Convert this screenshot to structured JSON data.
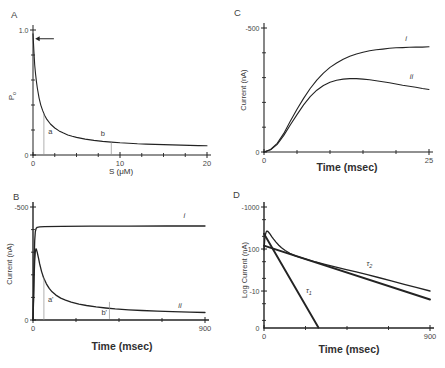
{
  "figure": {
    "ink": "#232323",
    "text_color": "#484848",
    "marker_color": "#8f8f8f",
    "background": "#ffffff"
  },
  "chart_data": [
    {
      "panel": "A",
      "type": "line",
      "xlabel": "S  (μM)",
      "ylabel": {
        "text": "P",
        "sub": "o"
      },
      "x_range": [
        0,
        20
      ],
      "y_range": [
        0,
        1.0
      ],
      "y_scale": "linear",
      "x_ticks": {
        "major": [
          {
            "v": 0,
            "label": "0"
          },
          {
            "v": 10,
            "label": "10"
          },
          {
            "v": 20,
            "label": "20"
          }
        ],
        "minor": [
          2.5,
          5,
          7.5,
          12.5,
          15,
          17.5
        ]
      },
      "y_ticks": {
        "major": [
          {
            "v": 1.0,
            "label": "1.0"
          },
          {
            "v": 0,
            "label": "0"
          }
        ],
        "minor": [
          0.2,
          0.4,
          0.6,
          0.8
        ]
      },
      "series": [
        {
          "name": "open-probability-vs-concentration",
          "width": 1.1,
          "points": [
            [
              0,
              0.97
            ],
            [
              0.1,
              0.83
            ],
            [
              0.2,
              0.72
            ],
            [
              0.3,
              0.645
            ],
            [
              0.4,
              0.583
            ],
            [
              0.5,
              0.532
            ],
            [
              0.7,
              0.455
            ],
            [
              0.9,
              0.399
            ],
            [
              1.1,
              0.357
            ],
            [
              1.35,
              0.316
            ],
            [
              1.6,
              0.285
            ],
            [
              2,
              0.248
            ],
            [
              2.5,
              0.216
            ],
            [
              3,
              0.193
            ],
            [
              3.5,
              0.175
            ],
            [
              4,
              0.161
            ],
            [
              4.5,
              0.15
            ],
            [
              5,
              0.141
            ],
            [
              6,
              0.127
            ],
            [
              7,
              0.117
            ],
            [
              8,
              0.109
            ],
            [
              9,
              0.103
            ],
            [
              10,
              0.098
            ],
            [
              11,
              0.094
            ],
            [
              12,
              0.09
            ],
            [
              13,
              0.087
            ],
            [
              14,
              0.085
            ],
            [
              15,
              0.083
            ],
            [
              16,
              0.081
            ],
            [
              17,
              0.079
            ],
            [
              18,
              0.077
            ],
            [
              19,
              0.075
            ],
            [
              20,
              0.074
            ]
          ]
        }
      ],
      "annotations": [
        {
          "type": "arrow",
          "y": 0.93,
          "x_from": 2.4,
          "x_to": 0.25
        },
        {
          "type": "vline",
          "x": 1.25,
          "y_from": 0,
          "y_to": 0.335
        },
        {
          "type": "vline",
          "x": 9,
          "y_from": 0,
          "y_to": 0.103
        },
        {
          "type": "text",
          "x": 1.75,
          "y": 0.17,
          "text": "a"
        },
        {
          "type": "text",
          "x": 7.8,
          "y": 0.155,
          "text": "b"
        }
      ],
      "layout": {
        "x0": 33,
        "x1": 207,
        "y0": 155,
        "y1": 30,
        "axis_w": 1.0,
        "panel_xy": [
          11,
          18
        ],
        "ylabel_xy": [
          14,
          96
        ],
        "ylabel_size": 8,
        "xlabel_xy": [
          121,
          174
        ],
        "xlabel_size": 8,
        "xlabel_weight": "normal"
      }
    },
    {
      "panel": "C",
      "type": "line",
      "xlabel": "Time (msec)",
      "ylabel": {
        "text": "Current  (nA)",
        "sub": ""
      },
      "x_range": [
        0,
        25
      ],
      "y_range": [
        0,
        500
      ],
      "y_scale": "linear",
      "x_ticks": {
        "major": [
          {
            "v": 0,
            "label": "0"
          },
          {
            "v": 25,
            "label": "25"
          }
        ],
        "minor": [
          5,
          10,
          15,
          20
        ]
      },
      "y_ticks": {
        "major": [
          {
            "v": 500,
            "label": "-500"
          },
          {
            "v": 0,
            "label": "0"
          }
        ],
        "minor": [
          100,
          200,
          300,
          400
        ]
      },
      "series": [
        {
          "name": "current-trace-i",
          "width": 1.1,
          "points": [
            [
              0,
              0
            ],
            [
              1,
              -10
            ],
            [
              2,
              -35
            ],
            [
              3,
              -75
            ],
            [
              4,
              -125
            ],
            [
              5,
              -172
            ],
            [
              6,
              -216
            ],
            [
              7,
              -256
            ],
            [
              8,
              -290
            ],
            [
              9,
              -318
            ],
            [
              10,
              -341
            ],
            [
              11,
              -359
            ],
            [
              12,
              -374
            ],
            [
              13,
              -386
            ],
            [
              14,
              -395
            ],
            [
              15,
              -402
            ],
            [
              16,
              -408
            ],
            [
              17,
              -412
            ],
            [
              18,
              -415
            ],
            [
              19,
              -418
            ],
            [
              20,
              -420
            ],
            [
              21,
              -421
            ],
            [
              22,
              -422
            ],
            [
              23,
              -423
            ],
            [
              24,
              -423
            ],
            [
              25,
              -424
            ]
          ]
        },
        {
          "name": "current-trace-ii",
          "width": 1.1,
          "points": [
            [
              0,
              0
            ],
            [
              1,
              -9
            ],
            [
              2,
              -31
            ],
            [
              3,
              -67
            ],
            [
              4,
              -110
            ],
            [
              5,
              -151
            ],
            [
              6,
              -190
            ],
            [
              7,
              -223
            ],
            [
              8,
              -249
            ],
            [
              9,
              -268
            ],
            [
              10,
              -281
            ],
            [
              11,
              -289
            ],
            [
              12,
              -294
            ],
            [
              13,
              -296
            ],
            [
              14,
              -296
            ],
            [
              15,
              -294
            ],
            [
              16,
              -291
            ],
            [
              17,
              -287
            ],
            [
              18,
              -283
            ],
            [
              19,
              -279
            ],
            [
              20,
              -274
            ],
            [
              21,
              -269
            ],
            [
              22,
              -265
            ],
            [
              23,
              -261
            ],
            [
              24,
              -256
            ],
            [
              25,
              -252
            ]
          ]
        }
      ],
      "annotations": [
        {
          "type": "text",
          "x": 21.4,
          "y": -447,
          "text": "i",
          "italic": true
        },
        {
          "type": "text",
          "x": 22.1,
          "y": -296,
          "text": "ii",
          "italic": true
        }
      ],
      "layout": {
        "x0": 42,
        "x1": 207,
        "y0": 152,
        "y1": 28,
        "axis_w": 1.1,
        "panel_xy": [
          12,
          16
        ],
        "ylabel_xy": [
          24,
          90
        ],
        "ylabel_size": 7.5,
        "xlabel_xy": [
          125,
          171
        ],
        "xlabel_size": 10.5,
        "xlabel_weight": "bold"
      }
    },
    {
      "panel": "B",
      "type": "line",
      "xlabel": "Time (msec)",
      "ylabel": {
        "text": "Current  (nA)",
        "sub": ""
      },
      "x_range": [
        0,
        900
      ],
      "y_range": [
        0,
        500
      ],
      "y_scale": "linear",
      "x_ticks": {
        "major": [
          {
            "v": 0,
            "label": "0"
          },
          {
            "v": 900,
            "label": "900"
          }
        ],
        "minor": [
          225,
          450,
          675
        ]
      },
      "y_ticks": {
        "major": [
          {
            "v": 500,
            "label": "-500"
          },
          {
            "v": 0,
            "label": "0"
          }
        ],
        "minor": [
          100,
          200,
          300,
          400
        ]
      },
      "series": [
        {
          "name": "current-trace-i",
          "width": 1.3,
          "points": [
            [
              0,
              0
            ],
            [
              3,
              -120
            ],
            [
              6,
              -260
            ],
            [
              9,
              -350
            ],
            [
              12,
              -390
            ],
            [
              16,
              -405
            ],
            [
              22,
              -410
            ],
            [
              35,
              -412
            ],
            [
              60,
              -413
            ],
            [
              150,
              -414
            ],
            [
              300,
              -415
            ],
            [
              500,
              -415
            ],
            [
              700,
              -416
            ],
            [
              900,
              -416
            ]
          ]
        },
        {
          "name": "current-trace-ii",
          "width": 1.3,
          "points": [
            [
              0,
              0
            ],
            [
              3,
              -90
            ],
            [
              6,
              -190
            ],
            [
              9,
              -260
            ],
            [
              12,
              -300
            ],
            [
              15,
              -315
            ],
            [
              18,
              -313
            ],
            [
              22,
              -300
            ],
            [
              28,
              -276
            ],
            [
              35,
              -248
            ],
            [
              45,
              -214
            ],
            [
              55,
              -188
            ],
            [
              70,
              -160
            ],
            [
              85,
              -140
            ],
            [
              100,
              -125
            ],
            [
              120,
              -110
            ],
            [
              145,
              -97
            ],
            [
              170,
              -88
            ],
            [
              200,
              -79
            ],
            [
              240,
              -70
            ],
            [
              280,
              -64
            ],
            [
              330,
              -58
            ],
            [
              380,
              -53
            ],
            [
              430,
              -49
            ],
            [
              500,
              -45
            ],
            [
              570,
              -42
            ],
            [
              650,
              -39
            ],
            [
              730,
              -37
            ],
            [
              820,
              -35
            ],
            [
              900,
              -33
            ]
          ]
        }
      ],
      "annotations": [
        {
          "type": "vline",
          "x": 57,
          "y_from": 0,
          "y_to": -188
        },
        {
          "type": "text",
          "x": 78,
          "y": -78,
          "text": "a'"
        },
        {
          "type": "vline",
          "x": 400,
          "y_from": -5,
          "y_to": -80
        },
        {
          "type": "text",
          "x": 358,
          "y": -20,
          "text": "b'"
        },
        {
          "type": "text",
          "x": 788,
          "y": -450,
          "text": "i",
          "italic": true
        },
        {
          "type": "text",
          "x": 760,
          "y": -52,
          "text": "ii",
          "italic": true
        }
      ],
      "layout": {
        "x0": 33,
        "x1": 205,
        "y0": 136,
        "y1": 23,
        "axis_w": 1.4,
        "panel_xy": [
          13,
          16
        ],
        "ylabel_xy": [
          12,
          80
        ],
        "ylabel_size": 7.5,
        "xlabel_xy": [
          122,
          166
        ],
        "xlabel_size": 10.5,
        "xlabel_weight": "bold"
      }
    },
    {
      "panel": "D",
      "type": "line",
      "xlabel": "Time (msec)",
      "ylabel": {
        "text": "Log Current  (nA)",
        "sub": ""
      },
      "x_range": [
        0,
        900
      ],
      "y_range": [
        1.32,
        1000
      ],
      "y_scale": "log",
      "y_base_label": "0",
      "x_ticks": {
        "major": [
          {
            "v": 0,
            "label": "0"
          },
          {
            "v": 900,
            "label": "900"
          }
        ],
        "minor": [
          225,
          450,
          675
        ]
      },
      "y_ticks": {
        "major": [
          {
            "v": 1000,
            "label": "-1000"
          },
          {
            "v": 100,
            "label": "-100"
          },
          {
            "v": 10,
            "label": "-10"
          }
        ],
        "minor": [
          500,
          200,
          50,
          20,
          5,
          2
        ]
      },
      "series": [
        {
          "name": "log-current-trace",
          "width": 1.3,
          "points": [
            [
              0,
              -95
            ],
            [
              4,
              -165
            ],
            [
              8,
              -225
            ],
            [
              12,
              -255
            ],
            [
              16,
              -268
            ],
            [
              20,
              -264
            ],
            [
              26,
              -247
            ],
            [
              33,
              -225
            ],
            [
              42,
              -198
            ],
            [
              52,
              -172
            ],
            [
              65,
              -146
            ],
            [
              80,
              -123
            ],
            [
              95,
              -107
            ],
            [
              115,
              -92
            ],
            [
              140,
              -79
            ],
            [
              170,
              -69
            ],
            [
              200,
              -62
            ],
            [
              240,
              -55
            ],
            [
              280,
              -49
            ],
            [
              330,
              -43
            ],
            [
              380,
              -38
            ],
            [
              440,
              -33
            ],
            [
              500,
              -28.5
            ],
            [
              560,
              -24.5
            ],
            [
              620,
              -21
            ],
            [
              690,
              -17.5
            ],
            [
              760,
              -14.5
            ],
            [
              830,
              -12
            ],
            [
              900,
              -10
            ]
          ]
        },
        {
          "name": "tau1-fit-line",
          "width": 1.9,
          "points": [
            [
              0,
              -230
            ],
            [
              295,
              -1.35
            ]
          ]
        },
        {
          "name": "tau2-fit-line",
          "width": 1.9,
          "points": [
            [
              0,
              -120
            ],
            [
              900,
              -6.3
            ]
          ]
        }
      ],
      "annotations": [
        {
          "type": "text",
          "x": 228,
          "y": -9.2,
          "text": "τ",
          "sub": "1",
          "italic": true
        },
        {
          "type": "text",
          "x": 556,
          "y": -40,
          "text": "τ",
          "sub": "2",
          "italic": true
        }
      ],
      "layout": {
        "x0": 42,
        "x1": 208,
        "y0": 144,
        "y1": 23,
        "axis_w": 1.4,
        "panel_xy": [
          11,
          14
        ],
        "ylabel_xy": [
          25,
          86
        ],
        "ylabel_size": 7.5,
        "xlabel_xy": [
          127,
          169
        ],
        "xlabel_size": 10.5,
        "xlabel_weight": "bold"
      }
    }
  ]
}
